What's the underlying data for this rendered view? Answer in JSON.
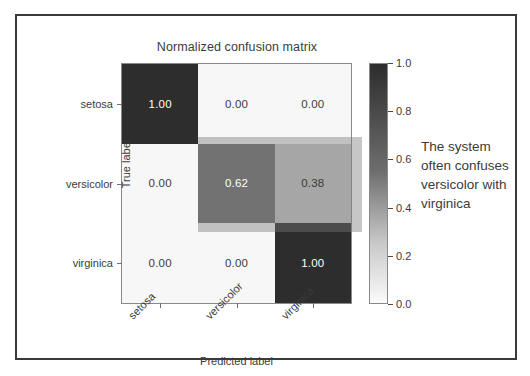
{
  "figure": {
    "title": "Normalized confusion matrix",
    "x_axis_label": "Predicted label",
    "y_axis_label": "True label"
  },
  "annotation": {
    "lines": [
      "The system",
      "often confuses",
      "versicolor with",
      "virginica"
    ]
  },
  "colorbar": {
    "ticks": [
      "1.0",
      "0.8",
      "0.6",
      "0.4",
      "0.2",
      "0.0"
    ],
    "top_color": "#2d2d2d",
    "bottom_color": "#fbfbfb"
  },
  "chart_data": {
    "type": "heatmap",
    "title": "Normalized confusion matrix",
    "xlabel": "Predicted label",
    "ylabel": "True label",
    "x_categories": [
      "setosa",
      "versicolor",
      "virginica"
    ],
    "y_categories": [
      "setosa",
      "versicolor",
      "virginica"
    ],
    "values": [
      [
        1.0,
        0.0,
        0.0
      ],
      [
        0.0,
        0.62,
        0.38
      ],
      [
        0.0,
        0.0,
        1.0
      ]
    ],
    "cell_labels": [
      [
        "1.00",
        "0.00",
        "0.00"
      ],
      [
        "0.00",
        "0.62",
        "0.38"
      ],
      [
        "0.00",
        "0.00",
        "1.00"
      ]
    ],
    "cell_fills": [
      [
        "#2d2d2d",
        "#f7f7f7",
        "#f7f7f7"
      ],
      [
        "#f7f7f7",
        "#6e6e6e",
        "#c9c9c9"
      ],
      [
        "#f7f7f7",
        "#f7f7f7",
        "#2d2d2d"
      ]
    ],
    "cell_text_colors": [
      [
        "#ffffff",
        "#3b3b3b",
        "#3b3b3b"
      ],
      [
        "#3b3b3b",
        "#ffffff",
        "#3b3b3b"
      ],
      [
        "#3b3b3b",
        "#3b3b3b",
        "#ffffff"
      ]
    ],
    "colormap": "Greys",
    "clim": [
      0.0,
      1.0
    ],
    "colorbar_ticks": [
      1.0,
      0.8,
      0.6,
      0.4,
      0.2,
      0.0
    ],
    "grid": false,
    "legend": "none",
    "highlight_region": {
      "rows": [
        "versicolor"
      ],
      "columns": [
        "versicolor",
        "virginica"
      ],
      "note": "The system often confuses versicolor with virginica"
    }
  }
}
